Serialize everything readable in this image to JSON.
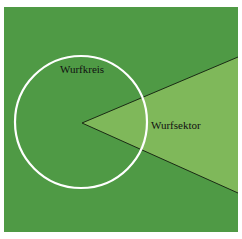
{
  "diagram": {
    "labels": {
      "circle": "Wurfkreis",
      "sector": "Wurfsektor"
    },
    "colors": {
      "background": "#ffffff",
      "field": "#4f9a45",
      "sector_fill": "#7fb85a",
      "circle_stroke": "#ffffff",
      "sector_lines": "#1a2a14"
    }
  }
}
